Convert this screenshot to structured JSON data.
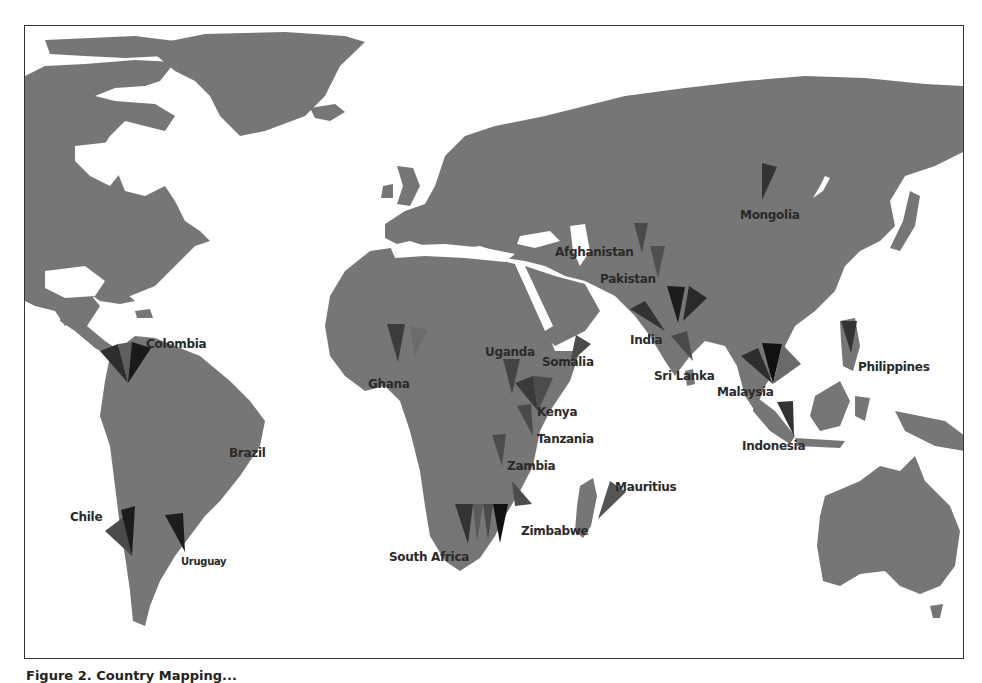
{
  "figure": {
    "caption": "Figure 2. Country Mapping..."
  },
  "map": {
    "type": "world-map",
    "style": "grayscale",
    "colors": {
      "background": "#ffffff",
      "land": "#767676",
      "wedge_dark": "#1e1e1e",
      "wedge_mid": "#3c3c3c",
      "wedge_light": "#5a5a5a",
      "label": "#2a2a2a"
    },
    "labels": [
      {
        "name": "Colombia"
      },
      {
        "name": "Brazil"
      },
      {
        "name": "Chile"
      },
      {
        "name": "Uruguay"
      },
      {
        "name": "Ghana"
      },
      {
        "name": "Uganda"
      },
      {
        "name": "Kenya"
      },
      {
        "name": "Tanzania"
      },
      {
        "name": "Zambia"
      },
      {
        "name": "Zimbabwe"
      },
      {
        "name": "South Africa"
      },
      {
        "name": "Mauritius"
      },
      {
        "name": "Somalia"
      },
      {
        "name": "Afghanistan"
      },
      {
        "name": "Pakistan"
      },
      {
        "name": "India"
      },
      {
        "name": "Sri Lanka"
      },
      {
        "name": "Mongolia"
      },
      {
        "name": "Malaysia"
      },
      {
        "name": "Indonesia"
      },
      {
        "name": "Philippines"
      }
    ]
  }
}
